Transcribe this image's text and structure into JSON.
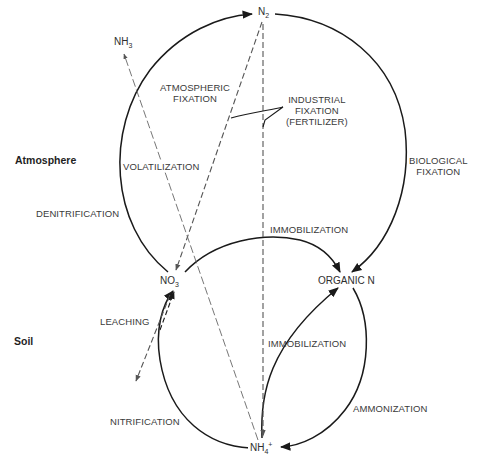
{
  "diagram": {
    "regions": {
      "atmosphere": "Atmosphere",
      "soil": "Soil"
    },
    "nodes": {
      "n2": {
        "base": "N",
        "sub": "2"
      },
      "nh3": {
        "base": "NH",
        "sub": "3"
      },
      "no3": {
        "base": "NO",
        "sub": "3",
        "sup": "-"
      },
      "organic_n": "ORGANIC N",
      "nh4": {
        "base": "NH",
        "sub": "4",
        "sup": "+"
      }
    },
    "processes": {
      "atmospheric_fixation": [
        "ATMOSPHERIC",
        "FIXATION"
      ],
      "industrial_fixation": [
        "INDUSTRIAL",
        "FIXATION",
        "(FERTILIZER)"
      ],
      "volatilization": "VOLATILIZATION",
      "biological_fixation": [
        "BIOLOGICAL",
        "FIXATION"
      ],
      "denitrification": "DENITRIFICATION",
      "immobilization_upper": "IMMOBILIZATION",
      "leaching": "LEACHING",
      "immobilization_lower": "IMMOBILIZATION",
      "nitrification": "NITRIFICATION",
      "ammonization": "AMMONIZATION"
    },
    "colors": {
      "solid_line": "#1a1a1a",
      "dashed_line": "#6a6a6a",
      "text": "#3a3a3a"
    }
  }
}
